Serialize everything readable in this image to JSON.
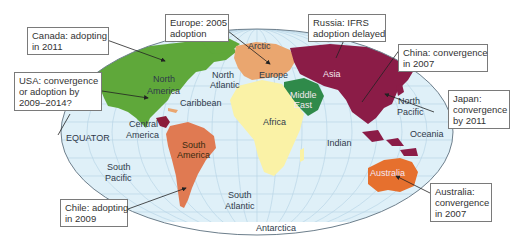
{
  "map": {
    "colors": {
      "ocean": "#dff0f8",
      "grid": "#b9d6e6",
      "border": "#6e7f8c",
      "north_america": "#5fa83a",
      "central_america_accent": "#8b1c3a",
      "south_america": "#e07a52",
      "europe": "#eaa66f",
      "asia": "#8b1c47",
      "middle_east": "#2f8a4a",
      "africa": "#faf2a6",
      "australia": "#e6702e",
      "antarctica": "#ffffff"
    },
    "region_labels": {
      "arctic": "Arctic",
      "north_america_1": "North",
      "north_america_2": "America",
      "north_atlantic_1": "North",
      "north_atlantic_2": "Atlantic",
      "caribbean": "Caribbean",
      "europe": "Europe",
      "asia": "Asia",
      "middle_east_1": "Middle",
      "middle_east_2": "East",
      "africa": "Africa",
      "central_america_1": "Central",
      "central_america_2": "America",
      "equator": "EQUATOR",
      "south_america_1": "South",
      "south_america_2": "America",
      "south_pacific_1": "South",
      "south_pacific_2": "Pacific",
      "south_atlantic_1": "South",
      "south_atlantic_2": "Atlantic",
      "indian": "Indian",
      "north_pacific_1": "North",
      "north_pacific_2": "Pacific",
      "oceania": "Oceania",
      "australia": "Australia",
      "antarctica": "Antarctica"
    }
  },
  "callouts": {
    "canada": {
      "line1": "Canada: adopting",
      "line2": "in 2011"
    },
    "usa": {
      "line1": "USA: convergence",
      "line2": "or adoption by",
      "line3": "2009–2014?"
    },
    "europe": {
      "line1": "Europe: 2005",
      "line2": "adoption"
    },
    "russia": {
      "line1": "Russia: IFRS",
      "line2": "adoption delayed"
    },
    "china": {
      "line1": "China: convergence",
      "line2": "in 2007"
    },
    "japan": {
      "line1": "Japan:",
      "line2": "convergence",
      "line3": "by 2011"
    },
    "australia": {
      "line1": "Australia:",
      "line2": "convergence",
      "line3": "in 2007"
    },
    "chile": {
      "line1": "Chile: adopting",
      "line2": "in 2009"
    }
  }
}
